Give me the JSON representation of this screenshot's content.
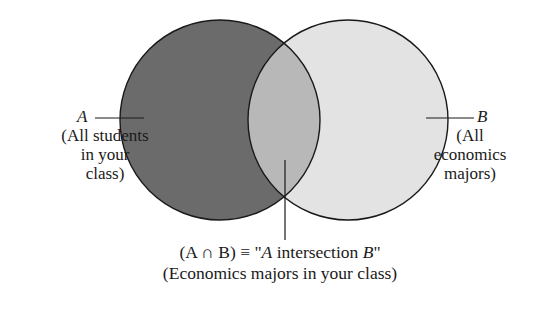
{
  "diagram": {
    "type": "venn",
    "sets": [
      {
        "id": "A",
        "symbol": "A",
        "description_lines": [
          "(All students",
          "in your",
          "class)"
        ],
        "fill": "#6b6b6b",
        "stroke": "#1a1a1a",
        "circle": {
          "cx": 220,
          "cy": 120,
          "r": 100
        }
      },
      {
        "id": "B",
        "symbol": "B",
        "description_lines": [
          "(All",
          "economics",
          "majors)"
        ],
        "fill": "#e3e3e3",
        "stroke": "#1a1a1a",
        "circle": {
          "cx": 348,
          "cy": 120,
          "r": 100
        }
      }
    ],
    "intersection": {
      "fill": "#b8b8b8",
      "notation_prefix": "(A ∩ B) ≡ \"",
      "notation_a": "A",
      "notation_middle": " intersection ",
      "notation_b": "B",
      "notation_suffix": "\"",
      "description": "(Economics majors in your class)"
    }
  }
}
